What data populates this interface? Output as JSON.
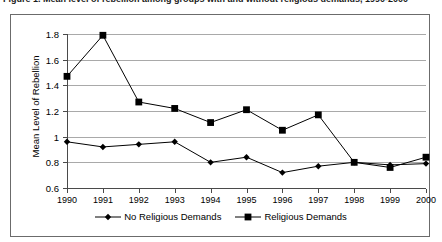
{
  "figure": {
    "caption_sliver": "Figure 1. Mean level of rebellion among groups with and without religious demands, 1990-2000"
  },
  "chart_data": {
    "type": "line",
    "title": "",
    "xlabel": "",
    "ylabel": "Mean Level of Rebellion",
    "categories": [
      "1990",
      "1991",
      "1992",
      "1993",
      "1994",
      "1995",
      "1996",
      "1997",
      "1998",
      "1999",
      "2000"
    ],
    "x_tick_labels": [
      "1990",
      "1991",
      "1992",
      "1993",
      "1994",
      "1995",
      "1996",
      "1997",
      "1998",
      "1999",
      "2000"
    ],
    "y_tick_labels": [
      "1.8",
      "1.6",
      "1.4",
      "1.2",
      "1",
      "0.8",
      "0.6"
    ],
    "y_tick_values": [
      1.8,
      1.6,
      1.4,
      1.2,
      1.0,
      0.8,
      0.6
    ],
    "ylim": [
      0.6,
      1.8
    ],
    "grid": "horizontal",
    "legend_position": "bottom",
    "series": [
      {
        "name": "No Religious Demands",
        "marker": "diamond",
        "color": "#000000",
        "values": [
          0.96,
          0.92,
          0.94,
          0.96,
          0.8,
          0.84,
          0.72,
          0.77,
          0.8,
          0.78,
          0.79
        ]
      },
      {
        "name": "Religious Demands",
        "marker": "square",
        "color": "#000000",
        "values": [
          1.47,
          1.79,
          1.27,
          1.22,
          1.11,
          1.21,
          1.05,
          1.17,
          0.8,
          0.76,
          0.84
        ]
      }
    ]
  },
  "colors": {
    "line": "#000000",
    "grid": "#a9a9a9",
    "axis": "#4a4a4a",
    "frame": "#6b6b6b",
    "background": "#ffffff"
  }
}
